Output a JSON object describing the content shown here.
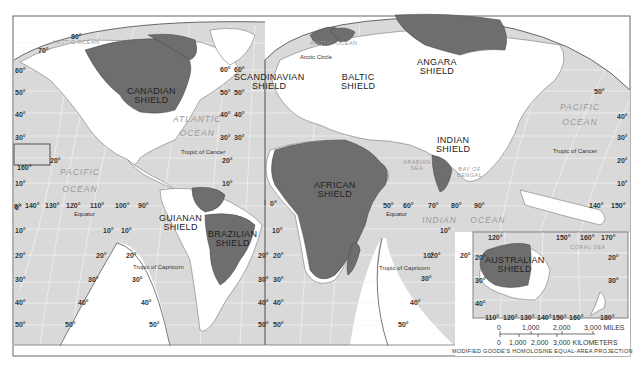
{
  "map": {
    "projection_label": "MODIFIED GOODE'S HOMOLOSINE EQUAL-AREA PROJECTION",
    "colors": {
      "ocean": "#d9d9d9",
      "land": "#ffffff",
      "shield": "#6e6e6e",
      "border": "#555555",
      "graticule": "#f2f2f2"
    },
    "shields": {
      "canadian": [
        "CANADIAN",
        "SHIELD"
      ],
      "scandinavian": [
        "SCANDINAVIAN",
        "SHIELD"
      ],
      "baltic": [
        "BALTIC",
        "SHIELD"
      ],
      "angara": [
        "ANGARA",
        "SHIELD"
      ],
      "african": [
        "AFRICAN",
        "SHIELD"
      ],
      "indian": [
        "INDIAN",
        "SHIELD"
      ],
      "guianan": [
        "GUIANAN",
        "SHIELD"
      ],
      "brazilian": [
        "BRAZILIAN",
        "SHIELD"
      ],
      "australian": [
        "AUSTRALIAN",
        "SHIELD"
      ]
    },
    "oceans": {
      "arctic_w": "ARCTIC OCEAN",
      "arctic_e": "ARCTIC OCEAN",
      "atlantic": [
        "ATLANTIC",
        "OCEAN"
      ],
      "pacific_w": [
        "PACIFIC",
        "OCEAN"
      ],
      "pacific_e": [
        "PACIFIC",
        "OCEAN"
      ],
      "indian": [
        "INDIAN",
        "OCEAN"
      ],
      "arabian_sea": [
        "ARABIAN",
        "SEA"
      ],
      "bay_of_bengal": [
        "BAY OF",
        "BENGAL"
      ],
      "coral_sea": "CORAL SEA"
    },
    "lines": {
      "arctic_circle": "Arctic Circle",
      "tropic_cancer_w": "Tropic of Cancer",
      "tropic_cancer_e": "Tropic of Cancer",
      "tropic_capricorn_w": "Tropic of Capricorn",
      "tropic_capricorn_e": "Tropic of Capricorn",
      "equator_w": "Equator",
      "equator_e": "Equator"
    },
    "degrees": {
      "west_lat": [
        "80°",
        "70°",
        "60°",
        "50°",
        "40°",
        "30°",
        "20°",
        "10°",
        "0°",
        "10°",
        "20°",
        "30°",
        "40°",
        "50°"
      ],
      "west_lon": [
        "160°",
        "140°",
        "130°",
        "120°",
        "110°",
        "100°",
        "90°"
      ],
      "center_lat_left": [
        "60°",
        "50°",
        "40°",
        "30°",
        "20°",
        "10°",
        "0°",
        "10°",
        "20°",
        "30°",
        "40°",
        "50°"
      ],
      "east_lon": [
        "50°",
        "60°",
        "70°",
        "80°",
        "90°",
        "140°",
        "150°"
      ],
      "east_lat": [
        "50°",
        "40°",
        "30°",
        "20°",
        "10°"
      ],
      "aus_top": [
        "120°",
        "150°",
        "160°",
        "170°"
      ],
      "aus_bottom": [
        "110°",
        "120°",
        "130°",
        "140°",
        "150°",
        "160°",
        "180°"
      ],
      "aus_lat": [
        "20°",
        "30°",
        "40°"
      ]
    },
    "scale_bar": {
      "miles": [
        "0",
        "1,000",
        "2,000",
        "3,000 MILES"
      ],
      "km": [
        "0",
        "1,000",
        "2,000",
        "3,000 KILOMETERS"
      ]
    }
  }
}
